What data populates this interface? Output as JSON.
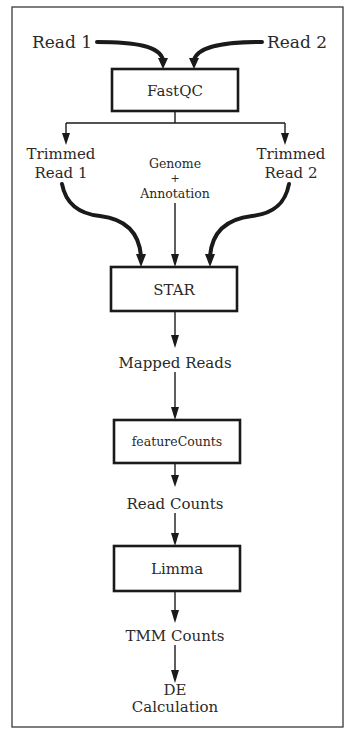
{
  "diagram": {
    "type": "pipeline-flowchart",
    "inputs": {
      "read1": "Read 1",
      "read2": "Read 2",
      "genome": "Genome",
      "plus": "+",
      "annotation": "Annotation"
    },
    "steps": [
      {
        "id": "fastqc",
        "label": "FastQC"
      },
      {
        "id": "star",
        "label": "STAR"
      },
      {
        "id": "featurecounts",
        "label": "featureCounts"
      },
      {
        "id": "limma",
        "label": "Limma"
      }
    ],
    "intermediates": {
      "trimmed_read1": [
        "Trimmed",
        "Read 1"
      ],
      "trimmed_read2": [
        "Trimmed",
        "Read 2"
      ],
      "mapped_reads": "Mapped Reads",
      "read_counts": "Read Counts",
      "tmm_counts": "TMM Counts"
    },
    "output": [
      "DE",
      "Calculation"
    ],
    "edges": [
      [
        "Read 1",
        "FastQC"
      ],
      [
        "Read 2",
        "FastQC"
      ],
      [
        "FastQC",
        "Trimmed Read 1"
      ],
      [
        "FastQC",
        "Trimmed Read 2"
      ],
      [
        "Trimmed Read 1",
        "STAR"
      ],
      [
        "Genome + Annotation",
        "STAR"
      ],
      [
        "Trimmed Read 2",
        "STAR"
      ],
      [
        "STAR",
        "Mapped Reads"
      ],
      [
        "Mapped Reads",
        "featureCounts"
      ],
      [
        "featureCounts",
        "Read Counts"
      ],
      [
        "Read Counts",
        "Limma"
      ],
      [
        "Limma",
        "TMM Counts"
      ],
      [
        "TMM Counts",
        "DE Calculation"
      ]
    ]
  }
}
